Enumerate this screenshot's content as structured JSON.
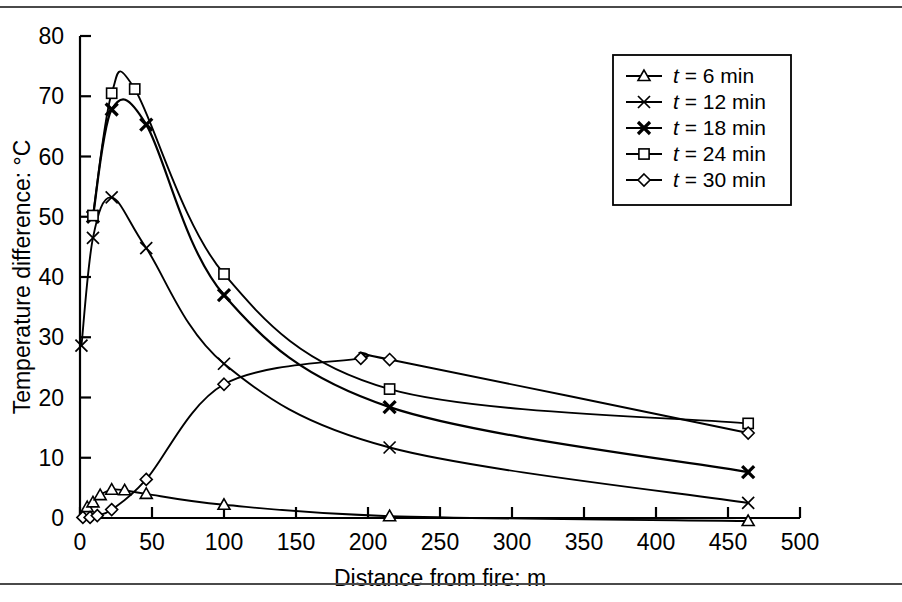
{
  "figure": {
    "has_top_rule": true,
    "has_bottom_rule": true,
    "background": "#ffffff",
    "ink_color": "#000000"
  },
  "chart_data": {
    "type": "line",
    "title": "",
    "subtitle": "",
    "xlabel": "Distance from fire: m",
    "ylabel": "Temperature difference: °C",
    "xlim": [
      0,
      500
    ],
    "ylim": [
      0,
      80
    ],
    "xticks": [
      0,
      50,
      100,
      150,
      200,
      250,
      300,
      350,
      400,
      450,
      500
    ],
    "xticklabels": [
      "0",
      "50",
      "100",
      "150",
      "200",
      "250",
      "300",
      "350",
      "400",
      "450",
      "500"
    ],
    "yticks": [
      0,
      10,
      20,
      30,
      40,
      50,
      60,
      70,
      80
    ],
    "yticklabels": [
      "0",
      "10",
      "20",
      "30",
      "40",
      "50",
      "60",
      "70",
      "80"
    ],
    "grid": false,
    "legend_position": "top-right",
    "series": [
      {
        "name": "t = 6 min",
        "label_prefix": "t",
        "label_rest": " = 6 min",
        "marker": "triangle",
        "x": [
          5,
          9,
          14,
          22,
          31,
          46,
          100,
          215,
          464
        ],
        "y": [
          1.8,
          2.6,
          3.8,
          4.7,
          4.6,
          4.0,
          2.2,
          0.3,
          -0.5
        ]
      },
      {
        "name": "t = 12 min",
        "label_prefix": "t",
        "label_rest": " = 12 min",
        "marker": "x-thin",
        "x": [
          1,
          9,
          22,
          46,
          100,
          215,
          464
        ],
        "y": [
          28.6,
          46.5,
          53.2,
          44.8,
          25.6,
          11.7,
          2.5
        ]
      },
      {
        "name": "t = 18 min",
        "label_prefix": "t",
        "label_rest": " = 18 min",
        "marker": "x-bold",
        "x": [
          9,
          22,
          46,
          100,
          215,
          464
        ],
        "y": [
          50.0,
          67.8,
          65.3,
          37.0,
          18.4,
          7.6
        ]
      },
      {
        "name": "t = 24 min",
        "label_prefix": "t",
        "label_rest": " = 24 min",
        "marker": "square",
        "x": [
          9,
          22,
          38,
          100,
          215,
          464
        ],
        "y": [
          50.2,
          70.5,
          71.2,
          40.5,
          21.4,
          15.7
        ]
      },
      {
        "name": "t = 30 min",
        "label_prefix": "t",
        "label_rest": " = 30 min",
        "marker": "diamond",
        "x": [
          2,
          7,
          12,
          22,
          46,
          100,
          195,
          215,
          464
        ],
        "y": [
          0.1,
          0.1,
          0.4,
          1.4,
          6.4,
          22.2,
          26.5,
          26.3,
          14.1
        ]
      }
    ]
  }
}
